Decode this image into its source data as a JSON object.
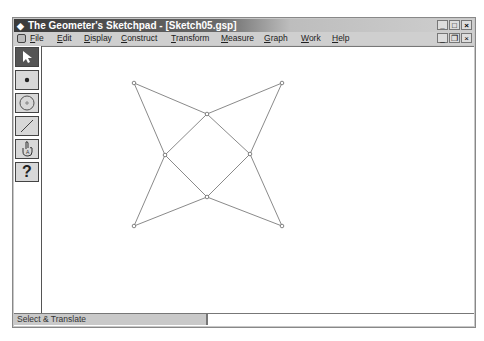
{
  "window": {
    "title": "The Geometer's Sketchpad - [Sketch05.gsp]",
    "title_buttons": [
      "minimize",
      "maximize",
      "close"
    ],
    "doc_buttons": [
      "minimize",
      "restore",
      "close"
    ]
  },
  "menubar": {
    "items": [
      {
        "label": "File"
      },
      {
        "label": "Edit"
      },
      {
        "label": "Display"
      },
      {
        "label": "Construct"
      },
      {
        "label": "Transform"
      },
      {
        "label": "Measure"
      },
      {
        "label": "Graph"
      },
      {
        "label": "Work"
      },
      {
        "label": "Help"
      }
    ]
  },
  "toolbox": {
    "tools": [
      {
        "name": "selection-arrow-tool",
        "active": true
      },
      {
        "name": "point-tool",
        "active": false
      },
      {
        "name": "compass-tool",
        "active": false
      },
      {
        "name": "straightedge-tool",
        "active": false
      },
      {
        "name": "text-tool",
        "active": false
      },
      {
        "name": "script-tool",
        "label": "?",
        "active": false
      }
    ]
  },
  "sketch": {
    "points": [
      {
        "x": 134,
        "y": 83
      },
      {
        "x": 282,
        "y": 83
      },
      {
        "x": 207,
        "y": 114
      },
      {
        "x": 165,
        "y": 155
      },
      {
        "x": 250,
        "y": 154
      },
      {
        "x": 207,
        "y": 197
      },
      {
        "x": 134,
        "y": 226
      },
      {
        "x": 282,
        "y": 226
      }
    ],
    "line_color": "#8a8a8a"
  },
  "statusbar": {
    "text": "Select & Translate"
  }
}
